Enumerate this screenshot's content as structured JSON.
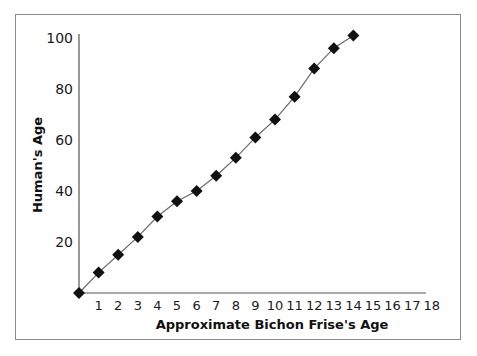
{
  "chart_data": {
    "type": "line",
    "title": "",
    "xlabel": "Approximate Bichon Frise's Age",
    "ylabel": "Human's Age",
    "x_ticks": [
      1,
      2,
      3,
      4,
      5,
      6,
      7,
      8,
      9,
      10,
      11,
      12,
      13,
      14,
      15,
      16,
      17,
      18
    ],
    "y_ticks": [
      20,
      40,
      60,
      80,
      100
    ],
    "xlim": [
      0,
      18
    ],
    "ylim": [
      0,
      100
    ],
    "grid": false,
    "legend": null,
    "marker": "filled-diamond",
    "series": [
      {
        "name": "Human's Age",
        "x": [
          0,
          1,
          2,
          3,
          4,
          5,
          6,
          7,
          8,
          9,
          10,
          11,
          12,
          13,
          14
        ],
        "values": [
          0,
          8,
          15,
          22,
          30,
          36,
          40,
          46,
          53,
          61,
          68,
          77,
          88,
          96,
          101
        ]
      }
    ]
  }
}
